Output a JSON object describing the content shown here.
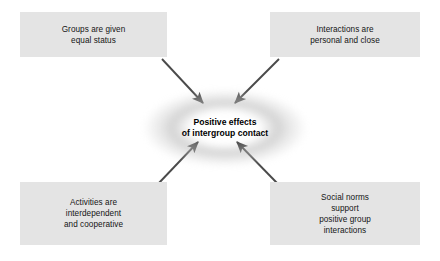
{
  "diagram": {
    "title": "Positive effects of intergroup contact",
    "type": "converging-arrow-diagram",
    "canvas": {
      "width": 440,
      "height": 261
    },
    "colors": {
      "background": "#ffffff",
      "box_fill": "#e4e4e4",
      "box_text": "#141414",
      "center_text": "#000000",
      "arrow": "#4a4a4a",
      "glow": "#b0b0b0"
    },
    "center": {
      "label": "Positive effects\nof intergroup contact",
      "line1": "Positive effects",
      "line2": "of intergroup contact",
      "shape": "ellipse"
    },
    "boxes": [
      {
        "id": "top-left",
        "label": "Groups are given\nequal status",
        "lines": [
          "Groups are given",
          "equal status"
        ],
        "position": "top-left"
      },
      {
        "id": "top-right",
        "label": "Interactions are\npersonal and close",
        "lines": [
          "Interactions are",
          "personal and close"
        ],
        "position": "top-right"
      },
      {
        "id": "bottom-left",
        "label": "Activities are\ninterdependent\nand cooperative",
        "lines": [
          "Activities are",
          "interdependent",
          "and cooperative"
        ],
        "position": "bottom-left"
      },
      {
        "id": "bottom-right",
        "label": "Social norms\nsupport\npositive group\ninteractions",
        "lines": [
          "Social norms",
          "support",
          "positive group",
          "interactions"
        ],
        "position": "bottom-right"
      }
    ],
    "arrows": [
      {
        "id": "arrow-top-left-to-center",
        "from": "top-left",
        "to": "center",
        "direction": "down-right"
      },
      {
        "id": "arrow-top-right-to-center",
        "from": "top-right",
        "to": "center",
        "direction": "down-left"
      },
      {
        "id": "arrow-bottom-left-to-center",
        "from": "bottom-left",
        "to": "center",
        "direction": "up-right"
      },
      {
        "id": "arrow-bottom-right-to-center",
        "from": "bottom-right",
        "to": "center",
        "direction": "up-left"
      }
    ]
  }
}
